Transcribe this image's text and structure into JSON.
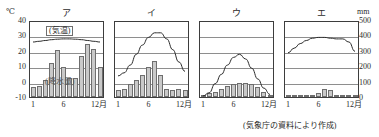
{
  "figure": {
    "left_axis_unit": "℃",
    "right_axis_unit": "mm",
    "caption": "(気象庁の資料により作成)",
    "temp_ticks": [
      "40",
      "30",
      "20",
      "10",
      "0",
      "-10"
    ],
    "precip_ticks": [
      "500",
      "400",
      "300",
      "200",
      "100",
      "0"
    ],
    "x_ticks": [
      "1",
      "6",
      "12月"
    ],
    "temp_label": "(気温)",
    "precip_label": "(降水量)"
  },
  "chart_data": [
    {
      "type": "bar",
      "title": "ア",
      "panel_index": 0,
      "categories": [
        "1",
        "2",
        "3",
        "4",
        "5",
        "6",
        "7",
        "8",
        "9",
        "10",
        "11",
        "12"
      ],
      "xlabel": "月",
      "ylabel": "気温(℃) / 降水量(mm)",
      "ylim": [
        -10,
        40
      ],
      "y2lim": [
        0,
        500
      ],
      "grid": true,
      "legend_position": "inside",
      "annotations": [
        "(気温)",
        "(降水量)"
      ],
      "series": [
        {
          "name": "降水量",
          "type": "bar",
          "unit": "mm",
          "values": [
            -3,
            -2,
            2,
            13,
            21,
            10,
            3,
            3,
            17,
            25,
            22,
            10
          ]
        },
        {
          "name": "気温",
          "type": "line",
          "unit": "℃",
          "values": [
            27,
            27.5,
            28,
            28.5,
            28.8,
            29,
            29,
            28.8,
            28.5,
            28,
            27.5,
            27
          ]
        }
      ]
    },
    {
      "type": "bar",
      "title": "イ",
      "panel_index": 1,
      "categories": [
        "1",
        "2",
        "3",
        "4",
        "5",
        "6",
        "7",
        "8",
        "9",
        "10",
        "11",
        "12"
      ],
      "xlabel": "月",
      "ylabel": "気温(℃) / 降水量(mm)",
      "ylim": [
        -10,
        40
      ],
      "y2lim": [
        0,
        500
      ],
      "grid": true,
      "legend_position": "none",
      "series": [
        {
          "name": "降水量",
          "type": "bar",
          "unit": "mm",
          "values": [
            -5,
            -4,
            -1,
            2,
            5,
            10,
            14,
            5,
            -4,
            -5,
            -4,
            -5
          ]
        },
        {
          "name": "気温",
          "type": "line",
          "unit": "℃",
          "values": [
            5,
            7,
            12,
            19,
            25,
            30,
            33,
            33,
            29,
            22,
            14,
            8
          ]
        }
      ]
    },
    {
      "type": "bar",
      "title": "ウ",
      "panel_index": 2,
      "categories": [
        "1",
        "2",
        "3",
        "4",
        "5",
        "6",
        "7",
        "8",
        "9",
        "10",
        "11",
        "12"
      ],
      "xlabel": "月",
      "ylabel": "気温(℃) / 降水量(mm)",
      "ylim": [
        -10,
        40
      ],
      "y2lim": [
        0,
        500
      ],
      "grid": true,
      "legend_position": "none",
      "series": [
        {
          "name": "降水量",
          "type": "bar",
          "unit": "mm",
          "values": [
            -8,
            -7,
            -6,
            -4,
            -2,
            -1,
            0,
            0,
            -1,
            -3,
            -6,
            -8
          ]
        },
        {
          "name": "気温",
          "type": "line",
          "unit": "℃",
          "values": [
            -8,
            -6,
            0,
            6,
            12,
            17,
            19,
            16,
            10,
            3,
            -3,
            -7
          ]
        }
      ]
    },
    {
      "type": "bar",
      "title": "エ",
      "panel_index": 3,
      "categories": [
        "1",
        "2",
        "3",
        "4",
        "5",
        "6",
        "7",
        "8",
        "9",
        "10",
        "11",
        "12"
      ],
      "xlabel": "月",
      "ylabel": "気温(℃) / 降水量(mm)",
      "ylim": [
        -10,
        40
      ],
      "y2lim": [
        0,
        500
      ],
      "grid": true,
      "legend_position": "none",
      "series": [
        {
          "name": "降水量",
          "type": "bar",
          "unit": "mm",
          "values": [
            -9,
            -9.5,
            -10,
            -10,
            -10,
            -7,
            -4,
            -5,
            -8,
            -9.5,
            -10,
            -10
          ]
        },
        {
          "name": "気温",
          "type": "line",
          "unit": "℃",
          "values": [
            20,
            23,
            26,
            28,
            29.5,
            30,
            30,
            29.5,
            29,
            29,
            27,
            21
          ]
        }
      ]
    }
  ]
}
